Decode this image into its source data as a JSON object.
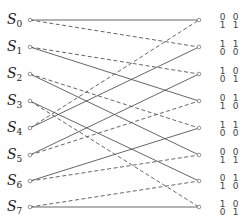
{
  "diagram": {
    "type": "trellis",
    "states": [
      {
        "name": "S",
        "index": "0"
      },
      {
        "name": "S",
        "index": "1"
      },
      {
        "name": "S",
        "index": "2"
      },
      {
        "name": "S",
        "index": "3"
      },
      {
        "name": "S",
        "index": "4"
      },
      {
        "name": "S",
        "index": "5"
      },
      {
        "name": "S",
        "index": "6"
      },
      {
        "name": "S",
        "index": "7"
      }
    ],
    "outputs": [
      {
        "a_top": "0",
        "a_bot": "1",
        "b_top": "0",
        "b_bot": "1"
      },
      {
        "a_top": "1",
        "a_bot": "0",
        "b_top": "1",
        "b_bot": "0"
      },
      {
        "a_top": "1",
        "a_bot": "0",
        "b_top": "0",
        "b_bot": "1"
      },
      {
        "a_top": "0",
        "a_bot": "1",
        "b_top": "1",
        "b_bot": "0"
      },
      {
        "a_top": "1",
        "a_bot": "0",
        "b_top": "1",
        "b_bot": "0"
      },
      {
        "a_top": "0",
        "a_bot": "1",
        "b_top": "0",
        "b_bot": "1"
      },
      {
        "a_top": "0",
        "a_bot": "1",
        "b_top": "1",
        "b_bot": "0"
      },
      {
        "a_top": "1",
        "a_bot": "0",
        "b_top": "0",
        "b_bot": "1"
      }
    ],
    "edges": [
      {
        "from": 0,
        "to": 0,
        "style": "solid"
      },
      {
        "from": 0,
        "to": 1,
        "style": "dashed"
      },
      {
        "from": 1,
        "to": 2,
        "style": "dashed"
      },
      {
        "from": 1,
        "to": 3,
        "style": "solid"
      },
      {
        "from": 2,
        "to": 4,
        "style": "dashed"
      },
      {
        "from": 2,
        "to": 5,
        "style": "solid"
      },
      {
        "from": 3,
        "to": 6,
        "style": "solid"
      },
      {
        "from": 3,
        "to": 7,
        "style": "dashed"
      },
      {
        "from": 4,
        "to": 0,
        "style": "dashed"
      },
      {
        "from": 4,
        "to": 1,
        "style": "solid"
      },
      {
        "from": 5,
        "to": 2,
        "style": "solid"
      },
      {
        "from": 5,
        "to": 3,
        "style": "dashed"
      },
      {
        "from": 6,
        "to": 4,
        "style": "solid"
      },
      {
        "from": 6,
        "to": 5,
        "style": "dashed"
      },
      {
        "from": 7,
        "to": 6,
        "style": "dashed"
      },
      {
        "from": 7,
        "to": 7,
        "style": "solid"
      }
    ],
    "colors": {
      "line": "#555555",
      "node": "#777777",
      "text": "#222222"
    }
  }
}
